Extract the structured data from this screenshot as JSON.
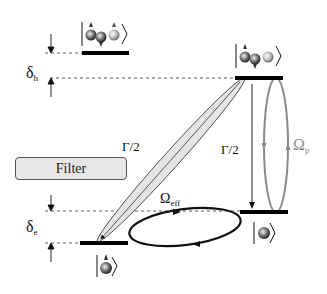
{
  "diagram": {
    "type": "energy-level-diagram",
    "labels": {
      "delta_h": {
        "symbol": "δ",
        "subscript": "h"
      },
      "delta_e": {
        "symbol": "δ",
        "subscript": "e"
      },
      "gamma_left": "Γ/2",
      "gamma_right": "Γ/2",
      "omega_eff": {
        "symbol": "Ω",
        "subscript": "eff"
      },
      "omega_p": {
        "symbol": "Ω",
        "subscript": "p"
      },
      "filter": "Filter"
    },
    "levels": [
      {
        "id": "top-left",
        "ket": "three-particle state (trion)",
        "position": "upper left"
      },
      {
        "id": "top-right",
        "ket": "three-particle state (trion)",
        "position": "upper right"
      },
      {
        "id": "bottom-right",
        "ket": "single-particle state",
        "position": "lower right"
      },
      {
        "id": "bottom-left",
        "ket": "single-particle state",
        "position": "lower left"
      }
    ],
    "transitions": [
      {
        "name": "spontaneous-decay-diagonal",
        "label": "Γ/2",
        "from": "top-right",
        "to": "bottom-left",
        "style": "shaded ellipse with arrow"
      },
      {
        "name": "spontaneous-decay-vertical",
        "label": "Γ/2",
        "from": "top-right",
        "to": "bottom-right",
        "style": "arrow"
      },
      {
        "name": "pump-rabi",
        "label": "Ωp",
        "between": [
          "top-right",
          "bottom-right"
        ],
        "style": "gray ellipse loop"
      },
      {
        "name": "effective-coupling",
        "label": "Ωeff",
        "between": [
          "bottom-left",
          "bottom-right"
        ],
        "style": "black ellipse loop"
      }
    ],
    "colors": {
      "line": "#111111",
      "pump_loop": "#8a8a8a",
      "filter_fill": "#e6e6e6",
      "decay_fill": "#e4e4e4"
    }
  }
}
